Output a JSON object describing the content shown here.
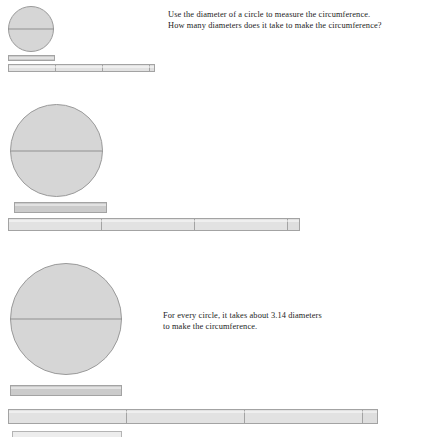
{
  "page": {
    "background_color": "#ffffff",
    "width": 442,
    "height": 435
  },
  "colors": {
    "circle_fill": "#d6d6d6",
    "circle_border": "#9a9a9a",
    "diameter_line": "#8f8f8f",
    "diameter_bar_fill": "#cbcbcb",
    "circumference_bar_fill": "#e2e2e2",
    "bar_border": "#a3a3a3",
    "text": "#1c1c1c"
  },
  "header": {
    "line1": "Use the diameter of a circle to measure the circumference.",
    "line2": "How many diameters does it take to make the circumference?"
  },
  "answer": {
    "line1": "For every circle, it takes about  3.14 diameters",
    "line2": "to make the circumference."
  },
  "constants": {
    "pi_label": "3.14",
    "full_diameter_segments": 3,
    "remainder_fraction": 0.14
  },
  "figures": [
    {
      "id": "figure-small",
      "circle": {
        "diameter_px": 46,
        "left": 8,
        "top": 6,
        "label": "small-circle"
      },
      "diameter_bar": {
        "left": 8,
        "top": 55,
        "width": 47,
        "height": 6
      },
      "circumference_bar": {
        "left": 8,
        "top": 64,
        "width": 147,
        "height": 8,
        "segments": [
          {
            "name": "diameter-1",
            "width_px": 47,
            "kind": "full"
          },
          {
            "name": "diameter-2",
            "width_px": 47,
            "kind": "full"
          },
          {
            "name": "diameter-3",
            "width_px": 47,
            "kind": "full"
          },
          {
            "name": "remainder-0.14",
            "width_px": 6,
            "kind": "remainder"
          }
        ]
      }
    },
    {
      "id": "figure-medium",
      "circle": {
        "diameter_px": 93,
        "left": 10,
        "top": 104,
        "label": "medium-circle"
      },
      "diameter_bar": {
        "left": 14,
        "top": 202,
        "width": 93,
        "height": 11
      },
      "circumference_bar": {
        "left": 8,
        "top": 218,
        "width": 292,
        "height": 13,
        "segments": [
          {
            "name": "diameter-1",
            "width_px": 93,
            "kind": "full"
          },
          {
            "name": "diameter-2",
            "width_px": 93,
            "kind": "full"
          },
          {
            "name": "diameter-3",
            "width_px": 93,
            "kind": "full"
          },
          {
            "name": "remainder-0.14",
            "width_px": 13,
            "kind": "remainder"
          }
        ]
      }
    },
    {
      "id": "figure-large",
      "circle": {
        "diameter_px": 112,
        "left": 10,
        "top": 263,
        "label": "large-circle"
      },
      "diameter_bar": {
        "left": 10,
        "top": 385,
        "width": 112,
        "height": 11
      },
      "circumference_bar": {
        "left": 8,
        "top": 409,
        "width": 370,
        "height": 15,
        "segments": [
          {
            "name": "diameter-1",
            "width_px": 118,
            "kind": "full"
          },
          {
            "name": "diameter-2",
            "width_px": 118,
            "kind": "full"
          },
          {
            "name": "diameter-3",
            "width_px": 118,
            "kind": "full"
          },
          {
            "name": "remainder-0.14",
            "width_px": 16,
            "kind": "remainder"
          }
        ]
      }
    }
  ],
  "clipped_bar": {
    "name": "clipped-bottom-bar",
    "left": 12,
    "top": 431,
    "width": 110,
    "height": 6
  }
}
